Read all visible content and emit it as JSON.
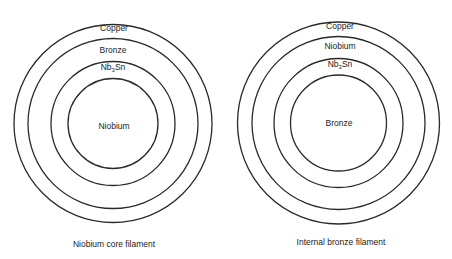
{
  "diagrams": [
    {
      "caption": "Niobium core filament",
      "center": [
        113,
        123.5
      ],
      "radii": [
        99,
        85,
        62,
        45
      ],
      "layers": {
        "outer": "Copper",
        "second": "Bronze",
        "third_main": "Nb",
        "third_sub": "3",
        "third_tail": "Sn",
        "core": "Niobium"
      }
    },
    {
      "caption": "Internal bronze filament",
      "center": [
        338.5,
        123
      ],
      "radii": [
        101,
        86.5,
        64.5,
        48
      ],
      "layers": {
        "outer": "Copper",
        "second": "Niobium",
        "third_main": "Nb",
        "third_sub": "3",
        "third_tail": "Sn",
        "core": "Bronze"
      }
    }
  ]
}
